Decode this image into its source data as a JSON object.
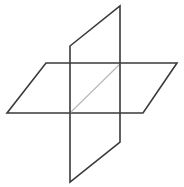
{
  "figure": {
    "canvas": {
      "width": 184,
      "height": 187,
      "background": "#ffffff"
    },
    "style": {
      "stroke_primary": "#3a3a3a",
      "stroke_secondary": "#b9b9b9",
      "stroke_width_primary": 1.6,
      "stroke_width_secondary": 1.2,
      "fill": "none"
    },
    "shapes": [
      {
        "name": "horizontal-parallelogram",
        "kind": "parallelogram",
        "stroke": "#3a3a3a",
        "stroke_width": 1.6,
        "points": "46,63 177,63 143,113 7,113",
        "vertices": [
          {
            "label": "top-left",
            "x": 46,
            "y": 63
          },
          {
            "label": "top-right",
            "x": 177,
            "y": 63
          },
          {
            "label": "bottom-right",
            "x": 143,
            "y": 113
          },
          {
            "label": "bottom-left",
            "x": 7,
            "y": 113
          }
        ]
      },
      {
        "name": "vertical-parallelogram",
        "kind": "parallelogram",
        "stroke": "#3a3a3a",
        "stroke_width": 1.6,
        "points": "70,46 120,6 120,142 70,182",
        "vertices": [
          {
            "label": "upper-left",
            "x": 70,
            "y": 46
          },
          {
            "label": "upper-right",
            "x": 120,
            "y": 6
          },
          {
            "label": "lower-right",
            "x": 120,
            "y": 142
          },
          {
            "label": "lower-left",
            "x": 70,
            "y": 182
          }
        ]
      }
    ],
    "diagonal": {
      "name": "central-diagonal",
      "stroke": "#b9b9b9",
      "stroke_width": 1.2,
      "x1": 70,
      "y1": 113,
      "x2": 120,
      "y2": 64
    }
  }
}
